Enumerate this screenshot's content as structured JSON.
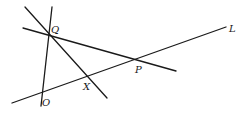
{
  "diagram": {
    "type": "geometry-lines",
    "stroke_color": "#1a1a1a",
    "background": "#ffffff",
    "lines": [
      {
        "id": "line-L",
        "x1": 12,
        "y1": 103,
        "x2": 226,
        "y2": 27
      },
      {
        "id": "line-QP",
        "x1": 23,
        "y1": 28,
        "x2": 176,
        "y2": 71
      },
      {
        "id": "line-QX",
        "x1": 25,
        "y1": 7,
        "x2": 107,
        "y2": 98
      },
      {
        "id": "line-QO",
        "x1": 52,
        "y1": 7,
        "x2": 41,
        "y2": 106
      }
    ],
    "labels": {
      "Q": {
        "text": "Q",
        "x": 51,
        "y": 33
      },
      "P": {
        "text": "P",
        "x": 135,
        "y": 73
      },
      "X": {
        "text": "X",
        "x": 83,
        "y": 90
      },
      "O": {
        "text": "O",
        "x": 42,
        "y": 106
      },
      "L": {
        "text": "L",
        "x": 229,
        "y": 32
      }
    }
  }
}
